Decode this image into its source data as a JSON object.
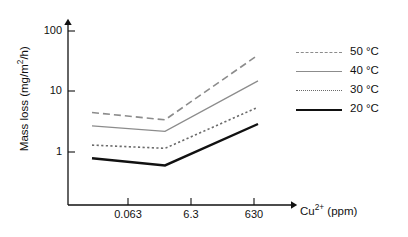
{
  "chart_data": {
    "type": "line",
    "title": "",
    "xlabel": "Cu2+ (ppm)",
    "xlabel_base": "Cu",
    "xlabel_sup": "2+",
    "xlabel_unit": " (ppm)",
    "ylabel": "Mass loss (mg/m2/h)",
    "ylabel_prefix": "Mass loss (mg/m",
    "ylabel_sup": "2",
    "ylabel_suffix": "/h)",
    "x_scale": "log",
    "y_scale": "log",
    "x_ticks": [
      "0.063",
      "6.3",
      "630"
    ],
    "x_values": [
      0.063,
      6.3,
      630
    ],
    "y_ticks": [
      "1",
      "10",
      "100"
    ],
    "y_values": [
      1,
      10,
      100
    ],
    "ylim": [
      0.33,
      200
    ],
    "grid": false,
    "legend_position": "right",
    "series": [
      {
        "name": "50 °C",
        "color": "#8c8c8c",
        "style": "dashed",
        "width": 1.6,
        "values": [
          4.5,
          3.4,
          40
        ]
      },
      {
        "name": "40 °C",
        "color": "#8c8c8c",
        "style": "solid",
        "width": 1.3,
        "values": [
          2.7,
          2.2,
          15
        ]
      },
      {
        "name": "30 °C",
        "color": "#6b6b6b",
        "style": "dotted",
        "width": 1.6,
        "values": [
          1.3,
          1.15,
          5.5
        ]
      },
      {
        "name": "20 °C",
        "color": "#111111",
        "style": "solid",
        "width": 2.4,
        "values": [
          0.79,
          0.6,
          2.9
        ]
      }
    ]
  },
  "legend": {
    "items": [
      {
        "label": "50 °C"
      },
      {
        "label": "40 °C"
      },
      {
        "label": "30 °C"
      },
      {
        "label": "20 °C"
      }
    ]
  },
  "axes": {
    "y_tick_labels": [
      "100",
      "10",
      "1"
    ],
    "x_tick_labels": [
      "0.063",
      "6.3",
      "630"
    ]
  }
}
